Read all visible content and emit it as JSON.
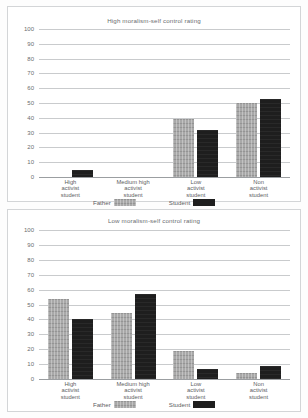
{
  "chart_data": [
    {
      "type": "bar",
      "title": "High moralism-self control rating",
      "xlabel": "",
      "ylabel": "",
      "ylim": [
        0,
        100
      ],
      "yticks": [
        100,
        90,
        80,
        70,
        60,
        50,
        40,
        30,
        20,
        10,
        0
      ],
      "grid": true,
      "legend_position": "bottom",
      "categories": [
        "High activist student",
        "Medium high activist student",
        "Low activist student",
        "Non activist student"
      ],
      "category_lines": [
        [
          "High",
          "activist",
          "student"
        ],
        [
          "Medium high",
          "activist",
          "student"
        ],
        [
          "Low",
          "activist",
          "student"
        ],
        [
          "Non",
          "activist",
          "student"
        ]
      ],
      "series": [
        {
          "name": "Father",
          "color": "#a8a8a8",
          "values": [
            0,
            0,
            39,
            50
          ]
        },
        {
          "name": "Student",
          "color": "#1e1e1e",
          "values": [
            5,
            0,
            32,
            53
          ]
        }
      ]
    },
    {
      "type": "bar",
      "title": "Low moralism-self control rating",
      "xlabel": "",
      "ylabel": "",
      "ylim": [
        0,
        100
      ],
      "yticks": [
        100,
        90,
        80,
        70,
        60,
        50,
        40,
        30,
        20,
        10,
        0
      ],
      "grid": true,
      "legend_position": "bottom",
      "categories": [
        "High activist student",
        "Medium high activist student",
        "Low activist student",
        "Non activist student"
      ],
      "category_lines": [
        [
          "High",
          "activist",
          "student"
        ],
        [
          "Medium high",
          "activist",
          "student"
        ],
        [
          "Low",
          "activist",
          "student"
        ],
        [
          "Non",
          "activist",
          "student"
        ]
      ],
      "series": [
        {
          "name": "Father",
          "color": "#a8a8a8",
          "values": [
            54,
            44,
            19,
            4
          ]
        },
        {
          "name": "Student",
          "color": "#1e1e1e",
          "values": [
            40,
            57,
            7,
            9
          ]
        }
      ]
    }
  ]
}
